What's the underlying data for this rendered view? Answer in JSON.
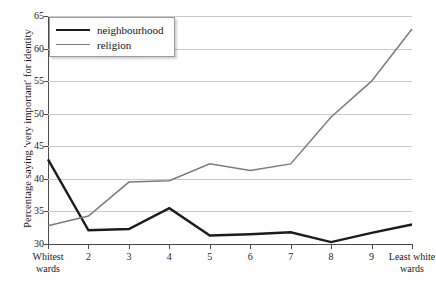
{
  "chart_data": {
    "type": "line",
    "title": "",
    "xlabel": "",
    "ylabel": "Percentage saying 'very important' for identity",
    "ylim": [
      30,
      65
    ],
    "yticks": [
      30,
      35,
      40,
      45,
      50,
      55,
      60,
      65
    ],
    "grid": true,
    "legend_position": "top-left",
    "categories": [
      "Whitest\nwards",
      "2",
      "3",
      "4",
      "5",
      "6",
      "7",
      "8",
      "9",
      "Least white\nwards"
    ],
    "x_tick_labels": [
      {
        "line1": "Whitest",
        "line2": "wards"
      },
      {
        "line1": "2",
        "line2": ""
      },
      {
        "line1": "3",
        "line2": ""
      },
      {
        "line1": "4",
        "line2": ""
      },
      {
        "line1": "5",
        "line2": ""
      },
      {
        "line1": "6",
        "line2": ""
      },
      {
        "line1": "7",
        "line2": ""
      },
      {
        "line1": "8",
        "line2": ""
      },
      {
        "line1": "9",
        "line2": ""
      },
      {
        "line1": "Least white",
        "line2": "wards"
      }
    ],
    "series": [
      {
        "name": "neighbourhood",
        "color": "#1c1c1c",
        "width": 2.4,
        "values": [
          43.0,
          32.1,
          32.3,
          35.5,
          31.3,
          31.5,
          31.8,
          30.3,
          31.7,
          33.0
        ]
      },
      {
        "name": "religion",
        "color": "#7b7b7b",
        "width": 1.5,
        "values": [
          32.8,
          34.3,
          39.5,
          39.7,
          42.3,
          41.3,
          42.3,
          49.5,
          55.0,
          63.0
        ]
      }
    ]
  },
  "legend": {
    "items": [
      {
        "label": "neighbourhood"
      },
      {
        "label": "religion"
      }
    ]
  },
  "axis": {
    "y_title": "Percentage saying 'very important' for identity"
  },
  "colors": {
    "neighbourhood": "#1c1c1c",
    "religion": "#7b7b7b",
    "grid": "#c9c9c9",
    "axis": "#4a4a4a",
    "background": "#ffffff"
  }
}
